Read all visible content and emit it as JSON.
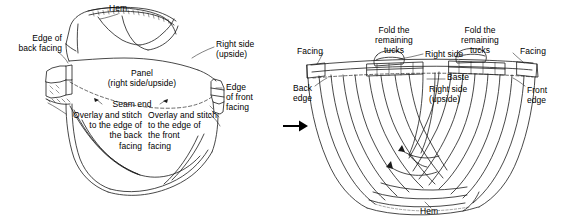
{
  "document": {
    "kind": "sewing-construction-diagram",
    "panel_count": 2
  },
  "colors": {
    "ink": "#1a1a1a",
    "paper": "#ffffff",
    "arrow": "#000000",
    "dashed": "#2b2b2b"
  },
  "transition": {
    "arrow_icon": "right-arrow-icon"
  },
  "figure_left": {
    "name": "panel-with-facings-step",
    "labels": {
      "hem": "Hem",
      "edge_of_back_facing": "Edge of\nback facing",
      "panel": "Panel\n(right side/upside)",
      "right_side_upside": "Right side\n(upside)",
      "edge_of_front_facing": "Edge\nof front\nfacing",
      "seam_end": "Seam end",
      "overlay_back": "Overlay and stitch\nto the edge of\nthe back\nfacing",
      "overlay_front": "Overlay and stitch\nto the edge of\nthe front\nfacing"
    }
  },
  "figure_right": {
    "name": "tucks-basted-step",
    "labels": {
      "facing_left": "Facing",
      "facing_right": "Facing",
      "fold_tucks_left": "Fold the\nremaining\ntucks",
      "fold_tucks_right": "Fold the\nremaining\ntucks",
      "right_side": "Right side",
      "baste": "Baste",
      "right_side_upside": "Right side\n(upside)",
      "back_edge": "Back\nedge",
      "front_edge": "Front\nedge",
      "hem": "Hem"
    }
  }
}
